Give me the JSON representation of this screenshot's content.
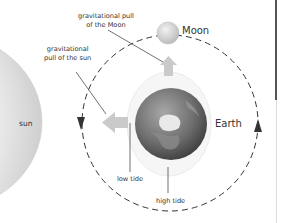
{
  "diagram": {
    "labels": {
      "moon_pull": "gravitational pull\nof the Moon",
      "moon_pull_line1": "gravitational pull",
      "moon_pull_line2": "of the Moon",
      "sun_pull_line1": "gravitational",
      "sun_pull_line2": "pull of the sun",
      "sun": "sun",
      "moon": "Moon",
      "earth": "Earth",
      "low_tide": "low tide",
      "high_tide": "high tide"
    },
    "colors": {
      "sun_fill": "#d9d9d9",
      "earth_dark": "#4a4a4a",
      "earth_light": "#bdbdbd",
      "tide_bulge": "#f4f4f4",
      "arrow": "#c8c8c8",
      "orbit": "#333333",
      "moon": "#d6d6d6"
    },
    "elements": [
      {
        "name": "sun",
        "shape": "partial circle at left edge"
      },
      {
        "name": "moon-orbit",
        "shape": "dashed circle",
        "direction": "counter-clockwise"
      },
      {
        "name": "earth",
        "shape": "globe"
      },
      {
        "name": "tidal-bulge",
        "shape": "ellipse around Earth"
      },
      {
        "name": "moon",
        "shape": "small sphere on orbit"
      },
      {
        "name": "arrow-toward-moon",
        "direction": "up"
      },
      {
        "name": "arrow-toward-sun",
        "direction": "left"
      }
    ]
  }
}
